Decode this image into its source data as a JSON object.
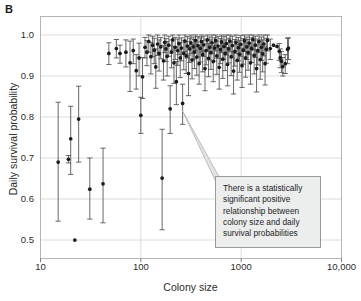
{
  "figure": {
    "panel_label": "B",
    "annotation": "There is a statistically significant positive relationship between colony size and daily survival probabilities"
  },
  "chart_data": {
    "type": "scatter",
    "title": "",
    "xlabel": "Colony size",
    "ylabel": "Daily survival probability",
    "xscale": "log",
    "yscale": "linear",
    "xlim": [
      10,
      10000
    ],
    "ylim": [
      0.455,
      1.045
    ],
    "xticks": [
      10,
      100,
      1000,
      10000
    ],
    "xtick_labels": [
      "10",
      "100",
      "1000",
      "10,000"
    ],
    "yticks": [
      0.5,
      0.6,
      0.7,
      0.8,
      0.9,
      1.0
    ],
    "ytick_labels": [
      "0.5",
      "0.6",
      "0.7",
      "0.8",
      "0.9",
      "1.0"
    ],
    "grid": true,
    "grid_color": "#d8d8d8",
    "legend": null,
    "marker": "filled-circle",
    "marker_color": "#1a1a1a",
    "errorbar_color": "#4d4d4d",
    "errorbar_type": "vertical-95CI",
    "series": [
      {
        "name": "Colony daily survival probability",
        "points": [
          {
            "x": 15,
            "y": 0.69,
            "lo": 0.546,
            "hi": 0.836
          },
          {
            "x": 19,
            "y": 0.697,
            "lo": 0.688,
            "hi": 0.706
          },
          {
            "x": 20,
            "y": 0.747,
            "lo": 0.66,
            "hi": 0.826
          },
          {
            "x": 22,
            "y": 0.5,
            "lo": 0.5,
            "hi": 0.5
          },
          {
            "x": 24,
            "y": 0.795,
            "lo": 0.69,
            "hi": 0.875
          },
          {
            "x": 31,
            "y": 0.624,
            "lo": 0.551,
            "hi": 0.7
          },
          {
            "x": 42,
            "y": 0.637,
            "lo": 0.542,
            "hi": 0.724
          },
          {
            "x": 48,
            "y": 0.955,
            "lo": 0.928,
            "hi": 0.981
          },
          {
            "x": 57,
            "y": 0.967,
            "lo": 0.944,
            "hi": 0.989
          },
          {
            "x": 62,
            "y": 0.955,
            "lo": 0.931,
            "hi": 0.975
          },
          {
            "x": 71,
            "y": 0.958,
            "lo": 0.922,
            "hi": 0.988
          },
          {
            "x": 78,
            "y": 0.932,
            "lo": 0.862,
            "hi": 0.985
          },
          {
            "x": 84,
            "y": 0.962,
            "lo": 0.93,
            "hi": 0.99
          },
          {
            "x": 90,
            "y": 0.913,
            "lo": 0.868,
            "hi": 0.952
          },
          {
            "x": 96,
            "y": 0.944,
            "lo": 0.9,
            "hi": 0.98
          },
          {
            "x": 100,
            "y": 0.804,
            "lo": 0.76,
            "hi": 0.848
          },
          {
            "x": 104,
            "y": 0.898,
            "lo": 0.845,
            "hi": 0.945
          },
          {
            "x": 110,
            "y": 0.97,
            "lo": 0.944,
            "hi": 0.994
          },
          {
            "x": 115,
            "y": 0.958,
            "lo": 0.925,
            "hi": 0.986
          },
          {
            "x": 120,
            "y": 0.984,
            "lo": 0.958,
            "hi": 1.0
          },
          {
            "x": 126,
            "y": 0.947,
            "lo": 0.905,
            "hi": 0.982
          },
          {
            "x": 131,
            "y": 0.975,
            "lo": 0.947,
            "hi": 0.997
          },
          {
            "x": 136,
            "y": 0.963,
            "lo": 0.93,
            "hi": 0.992
          },
          {
            "x": 141,
            "y": 0.922,
            "lo": 0.87,
            "hi": 0.966
          },
          {
            "x": 147,
            "y": 0.978,
            "lo": 0.95,
            "hi": 1.0
          },
          {
            "x": 152,
            "y": 0.955,
            "lo": 0.912,
            "hi": 0.988
          },
          {
            "x": 158,
            "y": 0.971,
            "lo": 0.942,
            "hi": 0.994
          },
          {
            "x": 163,
            "y": 0.651,
            "lo": 0.525,
            "hi": 0.77
          },
          {
            "x": 168,
            "y": 0.937,
            "lo": 0.89,
            "hi": 0.975
          },
          {
            "x": 173,
            "y": 0.982,
            "lo": 0.957,
            "hi": 1.0
          },
          {
            "x": 178,
            "y": 0.966,
            "lo": 0.935,
            "hi": 0.991
          },
          {
            "x": 183,
            "y": 0.948,
            "lo": 0.9,
            "hi": 0.984
          },
          {
            "x": 190,
            "y": 0.975,
            "lo": 0.948,
            "hi": 0.997
          },
          {
            "x": 196,
            "y": 0.82,
            "lo": 0.76,
            "hi": 0.876
          },
          {
            "x": 202,
            "y": 0.958,
            "lo": 0.92,
            "hi": 0.988
          },
          {
            "x": 208,
            "y": 0.988,
            "lo": 0.963,
            "hi": 1.0
          },
          {
            "x": 214,
            "y": 0.932,
            "lo": 0.882,
            "hi": 0.972
          },
          {
            "x": 220,
            "y": 0.97,
            "lo": 0.94,
            "hi": 0.994
          },
          {
            "x": 226,
            "y": 0.886,
            "lo": 0.83,
            "hi": 0.935
          },
          {
            "x": 233,
            "y": 0.962,
            "lo": 0.926,
            "hi": 0.99
          },
          {
            "x": 240,
            "y": 0.979,
            "lo": 0.952,
            "hi": 1.0
          },
          {
            "x": 247,
            "y": 0.944,
            "lo": 0.896,
            "hi": 0.982
          },
          {
            "x": 254,
            "y": 0.968,
            "lo": 0.937,
            "hi": 0.993
          },
          {
            "x": 261,
            "y": 0.833,
            "lo": 0.782,
            "hi": 0.88
          },
          {
            "x": 268,
            "y": 0.955,
            "lo": 0.915,
            "hi": 0.987
          },
          {
            "x": 275,
            "y": 0.985,
            "lo": 0.96,
            "hi": 1.0
          },
          {
            "x": 283,
            "y": 0.949,
            "lo": 0.906,
            "hi": 0.984
          },
          {
            "x": 291,
            "y": 0.973,
            "lo": 0.944,
            "hi": 0.996
          },
          {
            "x": 299,
            "y": 0.906,
            "lo": 0.852,
            "hi": 0.951
          },
          {
            "x": 307,
            "y": 0.966,
            "lo": 0.933,
            "hi": 0.992
          },
          {
            "x": 315,
            "y": 0.981,
            "lo": 0.955,
            "hi": 1.0
          },
          {
            "x": 324,
            "y": 0.939,
            "lo": 0.893,
            "hi": 0.977
          },
          {
            "x": 333,
            "y": 0.971,
            "lo": 0.941,
            "hi": 0.995
          },
          {
            "x": 342,
            "y": 0.958,
            "lo": 0.918,
            "hi": 0.989
          },
          {
            "x": 351,
            "y": 0.987,
            "lo": 0.962,
            "hi": 1.0
          },
          {
            "x": 361,
            "y": 0.946,
            "lo": 0.902,
            "hi": 0.983
          },
          {
            "x": 371,
            "y": 0.974,
            "lo": 0.946,
            "hi": 0.996
          },
          {
            "x": 381,
            "y": 0.93,
            "lo": 0.88,
            "hi": 0.971
          },
          {
            "x": 391,
            "y": 0.967,
            "lo": 0.934,
            "hi": 0.993
          },
          {
            "x": 402,
            "y": 0.984,
            "lo": 0.958,
            "hi": 1.0
          },
          {
            "x": 413,
            "y": 0.952,
            "lo": 0.91,
            "hi": 0.986
          },
          {
            "x": 424,
            "y": 0.976,
            "lo": 0.948,
            "hi": 0.997
          },
          {
            "x": 436,
            "y": 0.918,
            "lo": 0.864,
            "hi": 0.962
          },
          {
            "x": 448,
            "y": 0.962,
            "lo": 0.927,
            "hi": 0.99
          },
          {
            "x": 460,
            "y": 0.988,
            "lo": 0.963,
            "hi": 1.0
          },
          {
            "x": 473,
            "y": 0.943,
            "lo": 0.898,
            "hi": 0.98
          },
          {
            "x": 486,
            "y": 0.97,
            "lo": 0.939,
            "hi": 0.995
          },
          {
            "x": 499,
            "y": 0.957,
            "lo": 0.916,
            "hi": 0.988
          },
          {
            "x": 513,
            "y": 0.981,
            "lo": 0.954,
            "hi": 1.0
          },
          {
            "x": 527,
            "y": 0.935,
            "lo": 0.886,
            "hi": 0.974
          },
          {
            "x": 542,
            "y": 0.968,
            "lo": 0.936,
            "hi": 0.993
          },
          {
            "x": 557,
            "y": 0.986,
            "lo": 0.961,
            "hi": 1.0
          },
          {
            "x": 572,
            "y": 0.949,
            "lo": 0.904,
            "hi": 0.985
          },
          {
            "x": 588,
            "y": 0.973,
            "lo": 0.943,
            "hi": 0.996
          },
          {
            "x": 604,
            "y": 0.921,
            "lo": 0.868,
            "hi": 0.966
          },
          {
            "x": 621,
            "y": 0.964,
            "lo": 0.93,
            "hi": 0.991
          },
          {
            "x": 638,
            "y": 0.983,
            "lo": 0.957,
            "hi": 1.0
          },
          {
            "x": 656,
            "y": 0.941,
            "lo": 0.894,
            "hi": 0.979
          },
          {
            "x": 674,
            "y": 0.972,
            "lo": 0.941,
            "hi": 0.996
          },
          {
            "x": 693,
            "y": 0.955,
            "lo": 0.913,
            "hi": 0.988
          },
          {
            "x": 712,
            "y": 0.979,
            "lo": 0.951,
            "hi": 1.0
          },
          {
            "x": 732,
            "y": 0.928,
            "lo": 0.876,
            "hi": 0.97
          },
          {
            "x": 752,
            "y": 0.966,
            "lo": 0.932,
            "hi": 0.992
          },
          {
            "x": 773,
            "y": 0.985,
            "lo": 0.959,
            "hi": 1.0
          },
          {
            "x": 795,
            "y": 0.947,
            "lo": 0.901,
            "hi": 0.983
          },
          {
            "x": 817,
            "y": 0.974,
            "lo": 0.944,
            "hi": 0.997
          },
          {
            "x": 840,
            "y": 0.912,
            "lo": 0.856,
            "hi": 0.959
          },
          {
            "x": 864,
            "y": 0.96,
            "lo": 0.924,
            "hi": 0.989
          },
          {
            "x": 888,
            "y": 0.982,
            "lo": 0.955,
            "hi": 1.0
          },
          {
            "x": 913,
            "y": 0.938,
            "lo": 0.89,
            "hi": 0.977
          },
          {
            "x": 939,
            "y": 0.969,
            "lo": 0.937,
            "hi": 0.994
          },
          {
            "x": 965,
            "y": 0.953,
            "lo": 0.909,
            "hi": 0.987
          },
          {
            "x": 992,
            "y": 0.977,
            "lo": 0.948,
            "hi": 0.999
          },
          {
            "x": 1020,
            "y": 0.925,
            "lo": 0.872,
            "hi": 0.968
          },
          {
            "x": 1049,
            "y": 0.963,
            "lo": 0.929,
            "hi": 0.991
          },
          {
            "x": 1078,
            "y": 0.986,
            "lo": 0.96,
            "hi": 1.0
          },
          {
            "x": 1108,
            "y": 0.944,
            "lo": 0.897,
            "hi": 0.981
          },
          {
            "x": 1140,
            "y": 0.971,
            "lo": 0.94,
            "hi": 0.995
          },
          {
            "x": 1172,
            "y": 0.957,
            "lo": 0.914,
            "hi": 0.989
          },
          {
            "x": 1205,
            "y": 0.98,
            "lo": 0.952,
            "hi": 1.0
          },
          {
            "x": 1239,
            "y": 0.932,
            "lo": 0.88,
            "hi": 0.973
          },
          {
            "x": 1274,
            "y": 0.967,
            "lo": 0.933,
            "hi": 0.993
          },
          {
            "x": 1310,
            "y": 0.989,
            "lo": 0.963,
            "hi": 1.0
          },
          {
            "x": 1347,
            "y": 0.95,
            "lo": 0.905,
            "hi": 0.986
          },
          {
            "x": 1385,
            "y": 0.975,
            "lo": 0.945,
            "hi": 0.997
          },
          {
            "x": 1424,
            "y": 0.918,
            "lo": 0.861,
            "hi": 0.964
          },
          {
            "x": 1464,
            "y": 0.962,
            "lo": 0.927,
            "hi": 0.99
          },
          {
            "x": 1506,
            "y": 0.984,
            "lo": 0.957,
            "hi": 1.0
          },
          {
            "x": 1548,
            "y": 0.94,
            "lo": 0.892,
            "hi": 0.978
          },
          {
            "x": 1592,
            "y": 0.97,
            "lo": 0.938,
            "hi": 0.995
          },
          {
            "x": 1637,
            "y": 0.954,
            "lo": 0.91,
            "hi": 0.988
          },
          {
            "x": 1683,
            "y": 0.978,
            "lo": 0.949,
            "hi": 1.0
          },
          {
            "x": 1731,
            "y": 0.93,
            "lo": 0.878,
            "hi": 0.971
          },
          {
            "x": 1780,
            "y": 0.965,
            "lo": 0.931,
            "hi": 0.992
          },
          {
            "x": 1830,
            "y": 0.987,
            "lo": 0.961,
            "hi": 1.0
          },
          {
            "x": 1950,
            "y": 0.967,
            "lo": 0.94,
            "hi": 0.99
          },
          {
            "x": 2100,
            "y": 0.975,
            "lo": 0.975,
            "hi": 0.975
          },
          {
            "x": 2280,
            "y": 0.972,
            "lo": 0.972,
            "hi": 0.972
          },
          {
            "x": 2400,
            "y": 0.96,
            "lo": 0.938,
            "hi": 0.979
          },
          {
            "x": 2450,
            "y": 0.944,
            "lo": 0.92,
            "hi": 0.966
          },
          {
            "x": 2520,
            "y": 0.936,
            "lo": 0.908,
            "hi": 0.96
          },
          {
            "x": 2600,
            "y": 0.923,
            "lo": 0.9,
            "hi": 0.945
          },
          {
            "x": 2750,
            "y": 0.93,
            "lo": 0.906,
            "hi": 0.952
          },
          {
            "x": 2900,
            "y": 0.965,
            "lo": 0.93,
            "hi": 0.992
          },
          {
            "x": 2960,
            "y": 0.968,
            "lo": 0.94,
            "hi": 0.993
          }
        ]
      }
    ]
  }
}
